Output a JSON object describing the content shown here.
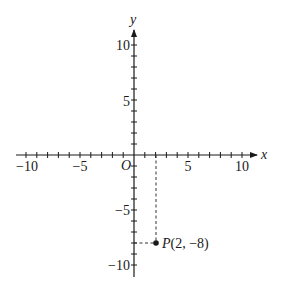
{
  "chart_data": {
    "type": "scatter",
    "title": "",
    "xlabel": "x",
    "ylabel": "y",
    "xlim": [
      -11,
      11
    ],
    "ylim": [
      -11,
      11
    ],
    "grid": false,
    "x_tick_labels": [
      "-10",
      "-5",
      "5",
      "10"
    ],
    "y_tick_labels": [
      "10",
      "5",
      "-5",
      "-10"
    ],
    "origin_label": "O",
    "minor_tick_step": 1,
    "points": [
      {
        "label": "P(2, −8)",
        "x": 2,
        "y": -8,
        "projection_lines": "dashed"
      }
    ]
  },
  "labels": {
    "x_axis": "x",
    "y_axis": "y",
    "origin": "O",
    "x_ticks": {
      "neg10": "−10",
      "neg5": "−5",
      "pos5": "5",
      "pos10": "10"
    },
    "y_ticks": {
      "pos10": "10",
      "pos5": "5",
      "neg5": "−5",
      "neg10": "−10"
    },
    "point_p": "P(2, −8)",
    "point_p_name": "P",
    "point_p_coords": "(2, −8)"
  },
  "colors": {
    "ink": "#1a1a1a",
    "background": "#ffffff"
  }
}
